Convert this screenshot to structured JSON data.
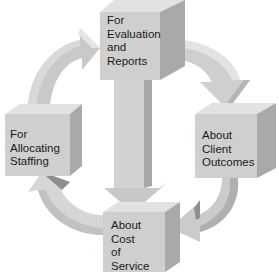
{
  "diagram": {
    "type": "cycle",
    "colors": {
      "box_front": "#cfcfcf",
      "box_top": "#e2e2e2",
      "box_side": "#a9a9a9",
      "arrow_light": "#dcdcdc",
      "arrow_mid": "#c4c4c4",
      "arrow_dark": "#9e9e9e",
      "text": "#1a1a1a",
      "background": "#ffffff"
    },
    "nodes": [
      {
        "id": "top",
        "lines": [
          "For",
          "Evaluation",
          "and",
          "Reports"
        ]
      },
      {
        "id": "right",
        "lines": [
          "About",
          "Client",
          "Outcomes"
        ]
      },
      {
        "id": "bottom",
        "lines": [
          "About",
          "Cost",
          "of",
          "Service"
        ]
      },
      {
        "id": "left",
        "lines": [
          "For",
          "Allocating",
          "Staffing"
        ]
      }
    ],
    "edges": [
      {
        "from": "left",
        "to": "top",
        "style": "curved-arrow"
      },
      {
        "from": "top",
        "to": "right",
        "style": "curved-arrow"
      },
      {
        "from": "right",
        "to": "bottom",
        "style": "curved-arrow"
      },
      {
        "from": "bottom",
        "to": "left",
        "style": "curved-arrow"
      },
      {
        "from": "top",
        "to": "bottom",
        "style": "straight-arrow"
      }
    ]
  }
}
